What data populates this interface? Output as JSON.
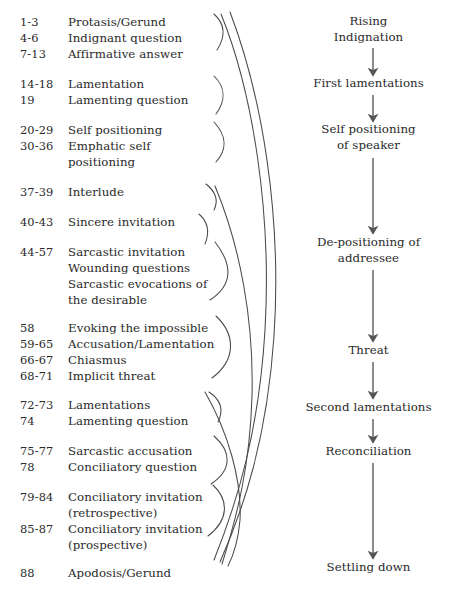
{
  "figure": {
    "type": "diagram",
    "title": "",
    "left_column_header": "",
    "right_column_header": ""
  },
  "left_entries": [
    {
      "verse": "1-3",
      "label": "Protasis/Gerund",
      "y": 14,
      "group": 1
    },
    {
      "verse": "4-6",
      "label": "Indignant question",
      "y": 30,
      "group": 1
    },
    {
      "verse": "7-13",
      "label": "Affirmative answer",
      "y": 46,
      "group": 1
    },
    {
      "verse": "14-18",
      "label": "Lamentation",
      "y": 76,
      "group": 2
    },
    {
      "verse": "19",
      "label": "Lamenting question",
      "y": 92,
      "group": 2
    },
    {
      "verse": "20-29",
      "label": "Self positioning",
      "y": 122,
      "group": 3
    },
    {
      "verse": "30-36",
      "label": "Emphatic self",
      "y": 138,
      "group": 3
    },
    {
      "verse": "",
      "label": "positioning",
      "y": 154,
      "group": 3
    },
    {
      "verse": "37-39",
      "label": "Interlude",
      "y": 184,
      "group": 4
    },
    {
      "verse": "40-43",
      "label": "Sincere invitation",
      "y": 214,
      "group": 5
    },
    {
      "verse": "44-57",
      "label": "Sarcastic invitation",
      "y": 244,
      "group": 6
    },
    {
      "verse": "",
      "label": "Wounding questions",
      "y": 260,
      "group": 6
    },
    {
      "verse": "",
      "label": "Sarcastic evocations of",
      "y": 276,
      "group": 6
    },
    {
      "verse": "",
      "label": "the desirable",
      "y": 292,
      "group": 6
    },
    {
      "verse": "58",
      "label": "Evoking the impossible",
      "y": 320,
      "group": 7
    },
    {
      "verse": "59-65",
      "label": "Accusation/Lamentation",
      "y": 336,
      "group": 7
    },
    {
      "verse": "66-67",
      "label": "Chiasmus",
      "y": 352,
      "group": 7
    },
    {
      "verse": "68-71",
      "label": "Implicit threat",
      "y": 368,
      "group": 7
    },
    {
      "verse": "72-73",
      "label": "Lamentations",
      "y": 397,
      "group": 8
    },
    {
      "verse": "74",
      "label": "Lamenting question",
      "y": 413,
      "group": 8
    },
    {
      "verse": "75-77",
      "label": "Sarcastic accusation",
      "y": 443,
      "group": 9
    },
    {
      "verse": "78",
      "label": "Conciliatory question",
      "y": 459,
      "group": 9
    },
    {
      "verse": "79-84",
      "label": "Conciliatory invitation",
      "y": 489,
      "group": 10
    },
    {
      "verse": "",
      "label": "(retrospective)",
      "y": 505,
      "group": 10
    },
    {
      "verse": "85-87",
      "label": "Conciliatory invitation",
      "y": 521,
      "group": 10
    },
    {
      "verse": "",
      "label": "(prospective)",
      "y": 537,
      "group": 10
    },
    {
      "verse": "88",
      "label": "Apodosis/Gerund",
      "y": 565,
      "group": 11
    }
  ],
  "right_stages": [
    {
      "lines": [
        "Rising",
        "Indignation"
      ],
      "y": 14,
      "arrow": {
        "x": 373,
        "y1": 48,
        "y2": 74
      }
    },
    {
      "lines": [
        "First lamentations"
      ],
      "y": 76,
      "arrow": {
        "x": 373,
        "y1": 95,
        "y2": 120
      }
    },
    {
      "lines": [
        "Self positioning",
        "of speaker"
      ],
      "y": 122,
      "arrow": {
        "x": 373,
        "y1": 158,
        "y2": 232
      }
    },
    {
      "lines": [
        "De-positioning of",
        "addressee"
      ],
      "y": 235,
      "arrow": {
        "x": 373,
        "y1": 270,
        "y2": 340
      }
    },
    {
      "lines": [
        "Threat"
      ],
      "y": 343,
      "arrow": {
        "x": 373,
        "y1": 362,
        "y2": 396
      }
    },
    {
      "lines": [
        "Second lamentations"
      ],
      "y": 400,
      "arrow": {
        "x": 373,
        "y1": 419,
        "y2": 440
      }
    },
    {
      "lines": [
        "Reconciliation"
      ],
      "y": 444,
      "arrow": {
        "x": 373,
        "y1": 463,
        "y2": 557
      }
    },
    {
      "lines": [
        "Settling down"
      ],
      "y": 560,
      "arrow": null
    }
  ],
  "colors": {
    "text": "#2a2a2a",
    "stroke": "#4a4a4a",
    "arrow": "#555555",
    "background": "#ffffff"
  }
}
